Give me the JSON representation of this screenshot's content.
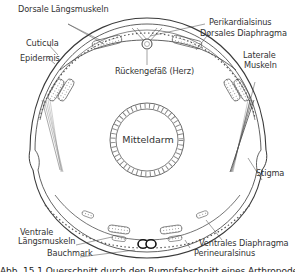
{
  "figure": {
    "type": "anatomical cross-section",
    "labels": {
      "dorsale_laengsmuskeln": "Dorsale Längsmuskeln",
      "cuticula": "Cuticula",
      "epidermis": "Epidermis",
      "rueckengefaess": "Rückengefäß (Herz)",
      "perikardialsinus": "Perikardialsinus",
      "dorsales_diaphragma": "Dorsales Diaphragma",
      "laterale_muskeln_1": "Laterale",
      "laterale_muskeln_2": "Muskeln",
      "mitteldarm": "Mitteldarm",
      "stigma": "Stigma",
      "ventrale_laengsmuskeln_1": "Ventrale",
      "ventrale_laengsmuskeln_2": "Längsmuskeln",
      "bauchmark": "Bauchmark",
      "ventrales_diaphragma": "Ventrales Diaphragma",
      "perineuralsinus": "Perineuralsinus"
    },
    "caption": "Abb. 15.1 Querschnitt durch den Rumpfabschnitt eines Arthropoden"
  },
  "colors": {
    "line": "#3a3a3a",
    "background": "#ffffff",
    "hatch": "#8a8a8a"
  }
}
